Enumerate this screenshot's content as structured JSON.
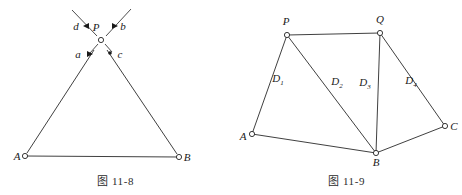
{
  "page": {
    "background_color": "#ffffff",
    "ink_color": "#1a1a1a",
    "width": 462,
    "height": 195
  },
  "figures": [
    {
      "id": "fig-11-8",
      "caption": "图 11-8",
      "description": "triangle-with-crossing-rays-at-apex",
      "nodes": [
        {
          "name": "A",
          "label": "A",
          "x": 25,
          "y": 156,
          "marker": "open-circle"
        },
        {
          "name": "B",
          "label": "B",
          "x": 179,
          "y": 157,
          "marker": "open-circle"
        },
        {
          "name": "P",
          "label": "P",
          "x": 101,
          "y": 40,
          "marker": "open-circle"
        }
      ],
      "edges": [
        {
          "from": "A",
          "to": "B"
        },
        {
          "from": "A",
          "to": "P"
        },
        {
          "from": "B",
          "to": "P"
        }
      ],
      "rays": [
        {
          "label": "d",
          "label_x": 76,
          "label_y": 27,
          "dot_x": 88,
          "dot_y": 26,
          "tip_x": 72,
          "tip_y": 10
        },
        {
          "label": "b",
          "label_x": 121,
          "label_y": 27,
          "dot_x": 113,
          "dot_y": 26,
          "tip_x": 130,
          "tip_y": 9
        },
        {
          "label": "a",
          "label_x": 77,
          "label_y": 56,
          "dot_x": 89,
          "dot_y": 54,
          "tip_x": 89,
          "tip_y": 54
        },
        {
          "label": "c",
          "label_x": 120,
          "label_y": 56,
          "dot_x": 110,
          "dot_y": 53,
          "tip_x": 110,
          "tip_y": 53
        }
      ]
    },
    {
      "id": "fig-11-9",
      "caption": "图 11-9",
      "description": "quadrilateral-network-with-four-distance-labels",
      "nodes": [
        {
          "name": "P",
          "label": "P",
          "x": 56,
          "y": 35,
          "marker": "open-circle"
        },
        {
          "name": "Q",
          "label": "Q",
          "x": 149,
          "y": 33,
          "marker": "open-circle"
        },
        {
          "name": "A",
          "label": "A",
          "x": 21,
          "y": 134,
          "marker": "open-circle"
        },
        {
          "name": "B",
          "label": "B",
          "x": 145,
          "y": 153,
          "marker": "open-circle"
        },
        {
          "name": "C",
          "label": "C",
          "x": 214,
          "y": 126,
          "marker": "open-circle"
        }
      ],
      "edges": [
        {
          "from": "P",
          "to": "Q"
        },
        {
          "from": "A",
          "to": "P"
        },
        {
          "from": "P",
          "to": "B"
        },
        {
          "from": "B",
          "to": "Q"
        },
        {
          "from": "Q",
          "to": "C"
        },
        {
          "from": "A",
          "to": "B"
        },
        {
          "from": "B",
          "to": "C"
        }
      ],
      "distance_labels": [
        {
          "name": "D1",
          "base": "D",
          "sub": "1",
          "edge": "A-P",
          "x": 47,
          "y": 78
        },
        {
          "name": "D2",
          "base": "D",
          "sub": "2",
          "edge": "P-B",
          "x": 106,
          "y": 81
        },
        {
          "name": "D3",
          "base": "D",
          "sub": "3",
          "edge": "B-Q",
          "x": 134,
          "y": 82
        },
        {
          "name": "D4",
          "base": "D",
          "sub": "4",
          "edge": "Q-C",
          "x": 180,
          "y": 80
        }
      ]
    }
  ]
}
